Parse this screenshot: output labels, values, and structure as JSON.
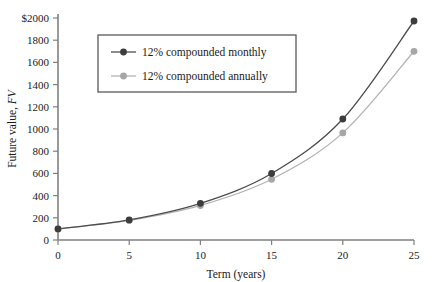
{
  "chart_data": {
    "type": "line",
    "title": "",
    "xlabel": "Term (years)",
    "ylabel": "Future value, FV",
    "ylabel_plain": "Future value,",
    "ylabel_italic": "FV",
    "xlim": [
      0,
      25
    ],
    "ylim": [
      0,
      2000
    ],
    "xticks": [
      0,
      5,
      10,
      15,
      20,
      25
    ],
    "xtick_labels": [
      "0",
      "5",
      "10",
      "15",
      "20",
      "25"
    ],
    "yticks": [
      0,
      200,
      400,
      600,
      800,
      1000,
      1200,
      1400,
      1600,
      1800,
      2000
    ],
    "ytick_labels": [
      "0",
      "200",
      "400",
      "600",
      "800",
      "1000",
      "1200",
      "1400",
      "1600",
      "1800",
      "$2000"
    ],
    "grid": false,
    "legend_position": "upper-left-inside",
    "x": [
      0,
      5,
      10,
      15,
      20,
      25
    ],
    "series": [
      {
        "name": "12% compounded monthly",
        "color": "#3d3d3d",
        "marker": "filled-circle",
        "values": [
          100,
          181,
          330,
          599,
          1090,
          1973
        ]
      },
      {
        "name": "12% compounded annually",
        "color": "#a6a6a6",
        "marker": "filled-circle",
        "values": [
          100,
          176,
          311,
          547,
          965,
          1700
        ]
      }
    ]
  },
  "legend": {
    "entries": [
      {
        "label": "12% compounded monthly"
      },
      {
        "label": "12% compounded annually"
      }
    ]
  },
  "colors": {
    "monthly": "#3d3d3d",
    "annually": "#a6a6a6",
    "axis": "#808080",
    "text": "#1a1a1a",
    "legend_border": "#595959",
    "background": "#ffffff"
  }
}
